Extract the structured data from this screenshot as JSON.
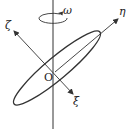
{
  "diagram": {
    "type": "rigid-body rotation about fixed axis",
    "labels": {
      "omega": "ω",
      "eta": "η",
      "zeta": "ζ",
      "xi": "ξ",
      "origin": "O"
    },
    "colors": {
      "line": "#333333",
      "background": "#ffffff"
    }
  }
}
